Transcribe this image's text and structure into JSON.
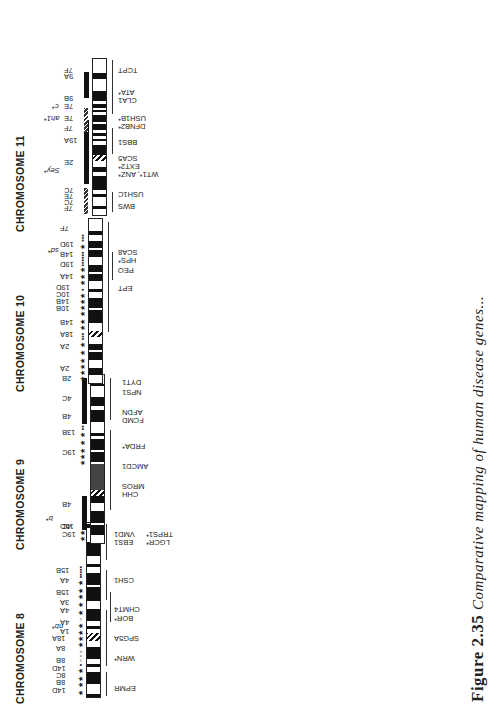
{
  "figure": {
    "caption_label": "Figure 2.35",
    "caption_text": "Comparative mapping of human disease genes..."
  },
  "chromosomes": [
    {
      "id": "8",
      "title": "CHROMOSOME 8",
      "top_labels": [
        "14D",
        "8B",
        "8C",
        "14D",
        "8B",
        "8A",
        "18A",
        "1A",
        "4A",
        "4A",
        "3A",
        "15B",
        "4A",
        "15B",
        "15D"
      ],
      "italic_labels": [
        "nb*"
      ],
      "genes": [
        "EPMR",
        "WRN*",
        "SPG5A",
        "BOR*",
        "CHMT4",
        "CSH1",
        "EBS1",
        "VMD1",
        "LGCR*",
        "TRPS1*"
      ]
    },
    {
      "id": "9",
      "title": "CHROMOSOME 9",
      "top_labels": [
        "19C",
        "4C",
        "4B",
        "19C",
        "13B",
        "4B",
        "4C",
        "2B"
      ],
      "italic_labels": [
        "b*"
      ],
      "genes": [
        "CHH",
        "MROS",
        "AMCD1",
        "FRDA*",
        "FCMD",
        "AFDN",
        "NPS1",
        "DYT1"
      ]
    },
    {
      "id": "10",
      "title": "CHROMOSOME 10",
      "top_labels": [
        "2A",
        "2A",
        "18A",
        "14B",
        "10B",
        "14B",
        "10C",
        "19D",
        "14A",
        "19D",
        "14B",
        "19D",
        "7F"
      ],
      "italic_labels": [
        "sd*"
      ],
      "genes": [
        "EPT",
        "PEO",
        "HPS*",
        "SCA8"
      ]
    },
    {
      "id": "11",
      "title": "CHROMOSOME 11",
      "top_labels": [
        "7F",
        "7C",
        "7E",
        "7C",
        "2E",
        "19A",
        "7F",
        "7E",
        "7E",
        "9B",
        "9A",
        "7F"
      ],
      "italic_labels": [
        "Sey*",
        "ah1*",
        "c*"
      ],
      "genes": [
        "BWS",
        "USH1C",
        "WT1*, ANZ*",
        "EXT2*",
        "SCA5",
        "BBS1",
        "DFNB2*",
        "USH1B*",
        "CLA1",
        "ATA*",
        "TCPT"
      ]
    },
    {
      "id": "12",
      "title": "CHROMOSOME 12",
      "top_labels": [
        "6G",
        "6E",
        "6F",
        "6G",
        "15F",
        "10D",
        "10D",
        "10D",
        "5F"
      ],
      "italic_labels": [
        "me*",
        "sw*",
        "mcd*",
        "pg*",
        "Sl*"
      ],
      "genes": [
        "ACLS",
        "DRPLA*",
        "ORW3",
        "MODY3*",
        "NS1",
        "PKU*",
        "SCA2*"
      ]
    },
    {
      "id": "X",
      "title": "CHROMOSOME X",
      "top_labels": [
        "1A",
        "1B",
        "XF",
        "XF",
        "XC",
        "XA",
        "XA",
        "XE",
        "XC",
        "XD",
        "XE",
        "XE",
        "XA",
        "XA",
        "XA-B"
      ],
      "italic_labels": [
        "Y",
        "mdx*",
        "spf*",
        "Mo*",
        "bt*"
      ],
      "genes": [
        "DMD*",
        "WAS*",
        "MNK*",
        "PMD*",
        "HEMA*"
      ]
    },
    {
      "id": "18",
      "title": "CHROMOSOME 18",
      "top_labels": [
        "17E",
        "18D",
        "18A",
        "18D",
        "1E",
        "18E"
      ],
      "italic_labels": [
        "ah*"
      ],
      "genes": [
        "HPE4",
        "NPC",
        "GTS",
        "MS"
      ]
    },
    {
      "id": "19",
      "title": "CHROMOSOME 19",
      "top_labels": [
        "10C",
        "17E",
        "8A",
        "8B",
        "8C",
        "7B",
        "7A",
        "7C",
        "17B",
        "7A"
      ],
      "italic_labels": [
        "bz*"
      ],
      "genes": [
        "EA2/MHP*",
        "PSACH*",
        "NPHS1",
        "DFNA4",
        "DM1",
        "HB1",
        "RP11"
      ]
    },
    {
      "id": "20",
      "title": "CHROMOSOME 20",
      "top_labels": [
        "2G",
        "2H",
        "2H",
        "2H"
      ],
      "italic_labels": [
        "un*",
        "a*",
        "lir*",
        "Bp*",
        "lw*",
        "mst*"
      ],
      "genes": [
        "AGS*",
        "MODY1*",
        "ENFL1*"
      ]
    },
    {
      "id": "21",
      "title": "CHROMOSOME 21",
      "top_labels": [
        "16C",
        "16C",
        "16C",
        "16C",
        "17E",
        "10C"
      ],
      "italic_labels": [
        "wv*"
      ],
      "genes": [
        "AD1*",
        "ALS*",
        "DSCR",
        "EPM1*",
        "APECED"
      ]
    },
    {
      "id": "22",
      "title": "CHROMOSOME 22",
      "top_labels": [
        "15B",
        "15E",
        "5F",
        "11A",
        "10C",
        "15E"
      ],
      "italic_labels": [
        "Dom*"
      ],
      "genes": [
        "CTHM",
        "DGCR",
        "SFD*"
      ]
    }
  ]
}
